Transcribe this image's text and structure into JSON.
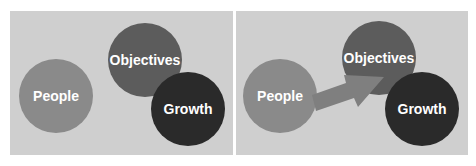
{
  "colors": {
    "background": "#cfcfcf",
    "people": "#8a8a8a",
    "objectives": "#5c5c5c",
    "growth": "#2a2a2a",
    "arrow": "#7f7f7f",
    "text": "#ffffff"
  },
  "panels": [
    {
      "id": "before",
      "circles": [
        {
          "label": "People"
        },
        {
          "label": "Objectives"
        },
        {
          "label": "Growth"
        }
      ],
      "has_arrow": false
    },
    {
      "id": "after",
      "circles": [
        {
          "label": "People"
        },
        {
          "label": "Objectives"
        },
        {
          "label": "Growth"
        }
      ],
      "has_arrow": true,
      "arrow": {
        "from": "People",
        "to": "Objectives"
      }
    }
  ]
}
